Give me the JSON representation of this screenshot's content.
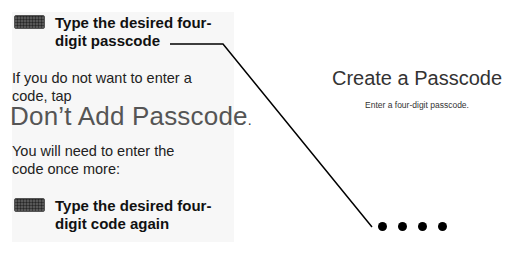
{
  "instructions": {
    "step1": {
      "icon": "keyboard-icon",
      "line1": "Type the desired four-",
      "line2": "digit passcode"
    },
    "skip_text": {
      "line1": "If you do not want to enter a",
      "line2": "code, tap"
    },
    "skip_button_label": "Don’t Add Passcode",
    "skip_period": ".",
    "repeat_text": {
      "line1": "You will need to enter the",
      "line2": "code once more:"
    },
    "step2": {
      "icon": "keyboard-icon",
      "line1": "Type the desired four-",
      "line2": "digit code again"
    }
  },
  "screen": {
    "title": "Create a Passcode",
    "subtitle": "Enter a four-digit passcode.",
    "passcode_dots": 4
  },
  "colors": {
    "panel_bg": "#f7f7f7",
    "leader_line": "#000000"
  }
}
